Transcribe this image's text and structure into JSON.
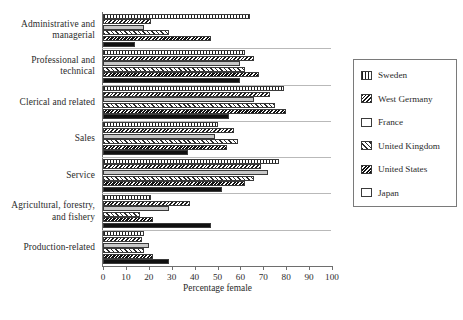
{
  "chart_data": {
    "type": "bar",
    "orientation": "horizontal",
    "title": "",
    "xlabel": "Percentage female",
    "ylabel": "",
    "xlim": [
      0,
      100
    ],
    "xticks": [
      0,
      10,
      20,
      30,
      40,
      50,
      60,
      70,
      80,
      90,
      100
    ],
    "grid": false,
    "legend_position": "right",
    "categories": [
      "Administrative and managerial",
      "Professional and technical",
      "Clerical and related",
      "Sales",
      "Service",
      "Agricultural, forestry, and fishery",
      "Production-related"
    ],
    "category_lines": [
      [
        "Administrative and",
        "managerial"
      ],
      [
        "Professional and",
        "technical"
      ],
      [
        "Clerical and related"
      ],
      [
        "Sales"
      ],
      [
        "Service"
      ],
      [
        "Agricultural, forestry,",
        "and fishery"
      ],
      [
        "Production-related"
      ]
    ],
    "series": [
      {
        "name": "Sweden",
        "pattern": "vertical-lines",
        "values": [
          64,
          62,
          79,
          50,
          77,
          21,
          18
        ]
      },
      {
        "name": "West Germany",
        "pattern": "dense-back-hatch",
        "values": [
          21,
          66,
          73,
          57,
          69,
          38,
          17
        ]
      },
      {
        "name": "France",
        "pattern": "light-gray-solid",
        "values": [
          18,
          60,
          66,
          49,
          72,
          29,
          20
        ]
      },
      {
        "name": "United Kingdom",
        "pattern": "diagonal-stripes",
        "values": [
          29,
          62,
          75,
          59,
          66,
          16,
          18
        ]
      },
      {
        "name": "United States",
        "pattern": "dense-back-hatch-bold",
        "values": [
          47,
          68,
          80,
          54,
          62,
          22,
          22
        ]
      },
      {
        "name": "Japan",
        "pattern": "solid-black",
        "values": [
          14,
          60,
          55,
          37,
          52,
          47,
          29
        ]
      }
    ]
  },
  "legend": {
    "items": [
      "Sweden",
      "West Germany",
      "France",
      "United Kingdom",
      "United States",
      "Japan"
    ]
  },
  "axis": {
    "x_title": "Percentage female"
  }
}
